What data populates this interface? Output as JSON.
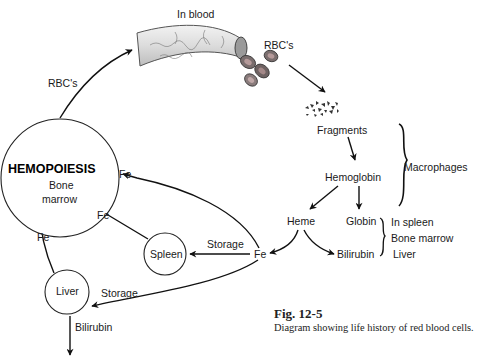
{
  "diagram": {
    "title": "Life history of red blood cells",
    "nodes": {
      "in_blood": "In blood",
      "rbcs_top": "RBC's",
      "rbcs_left": "RBC's",
      "fragments": "Fragments",
      "hemoglobin": "Hemoglobin",
      "macrophages": "Macrophages",
      "heme": "Heme",
      "globin": "Globin",
      "bilirubin_right": "Bilirubin",
      "locations": [
        "In spleen",
        "Bone marrow",
        "Liver"
      ],
      "fe_center": "Fe",
      "hemopoiesis": "HEMOPOIESIS",
      "bone": "Bone",
      "marrow": "marrow",
      "spleen": "Spleen",
      "liver": "Liver",
      "fe_top": "Fe",
      "fe_mid": "Fe",
      "fe_left": "Fe",
      "storage_spleen": "Storage",
      "storage_liver": "Storage",
      "bilirubin_out": "Bilirubin"
    },
    "colors": {
      "ink": "#111111",
      "vessel": "#d9d9d9",
      "rbc_outer": "#6e6e6e",
      "rbc_inner": "#a88a8a"
    }
  },
  "caption": {
    "figure": "Fig. 12-5",
    "description": "Diagram showing life history of red blood cells."
  }
}
